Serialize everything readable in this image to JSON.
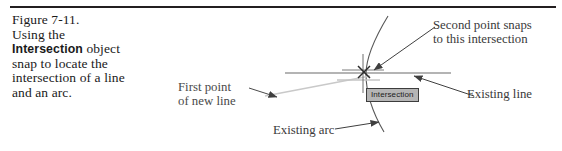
{
  "figure": {
    "caption": {
      "lines": [
        "Figure 7-11.",
        "Using the",
        "object",
        "snap to locate the",
        "intersection of a line",
        "and an arc."
      ],
      "bold_term": "Intersection"
    },
    "annotations": {
      "first_point": {
        "line1": "First point",
        "line2": "of new line"
      },
      "second_point": {
        "line1": "Second point snaps",
        "line2": "to this intersection"
      },
      "existing_line": "Existing line",
      "existing_arc": "Existing arc"
    },
    "tooltip": {
      "label": "Intersection"
    },
    "colors": {
      "rule": "#231f20",
      "caption_text": "#1a1a1a",
      "annotation_text": "#3a3a3a",
      "geometry_stroke": "#5a5a5a",
      "rubber_band": "#c9c9c9",
      "tooltip_background": "#b5b5b5",
      "tooltip_border": "#3d3d3d"
    }
  }
}
